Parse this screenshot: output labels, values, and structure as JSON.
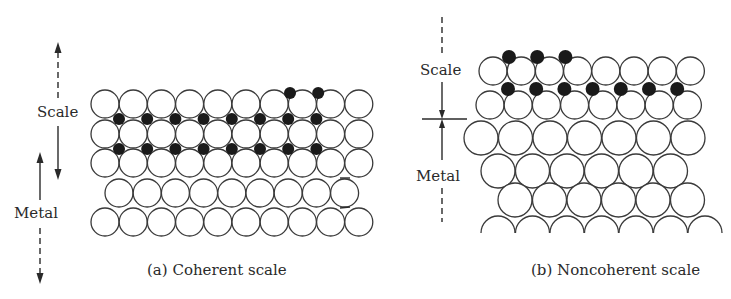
{
  "figure": {
    "panels": [
      {
        "id": "a",
        "caption": "(a)  Coherent scale",
        "labels": {
          "scale": "Scale",
          "metal": "Metal"
        },
        "lattice": {
          "rows": [
            {
              "y": 104,
              "x0": 105,
              "count": 10,
              "r": 14,
              "pitch": 28.2
            },
            {
              "y": 134,
              "x0": 105,
              "count": 10,
              "r": 14,
              "pitch": 28.2
            },
            {
              "y": 163,
              "x0": 105,
              "count": 10,
              "r": 14,
              "pitch": 28.2
            },
            {
              "y": 193,
              "x0": 119,
              "count": 9,
              "r": 14,
              "pitch": 28.2
            },
            {
              "y": 222,
              "x0": 105,
              "count": 10,
              "r": 14,
              "pitch": 28.2
            }
          ],
          "dots": [
            {
              "y": 119,
              "x0": 119,
              "count": 8,
              "pitch": 28.2,
              "r": 6
            },
            {
              "y": 149,
              "x0": 119,
              "count": 8,
              "pitch": 28.2,
              "r": 6
            },
            {
              "y": 93,
              "x0": 290,
              "count": 2,
              "pitch": 28.2,
              "r": 6
            }
          ]
        }
      },
      {
        "id": "b",
        "caption": "(b)  Noncoherent scale",
        "labels": {
          "scale": "Scale",
          "metal": "Metal"
        },
        "lattice": {
          "rows": [
            {
              "y": 71,
              "x0": 493,
              "count": 8,
              "r": 14,
              "pitch": 28.2
            },
            {
              "y": 105,
              "x0": 490,
              "count": 8,
              "r": 14,
              "pitch": 28.2
            },
            {
              "y": 138,
              "x0": 481,
              "count": 7,
              "r": 17,
              "pitch": 34.5
            },
            {
              "y": 171,
              "x0": 498,
              "count": 6,
              "r": 17,
              "pitch": 34.5
            },
            {
              "y": 200,
              "x0": 515,
              "count": 6,
              "r": 17,
              "pitch": 34.5
            }
          ],
          "dots": [
            {
              "y": 57,
              "x0": 509,
              "count": 3,
              "pitch": 28.2,
              "r": 7
            },
            {
              "y": 89,
              "x0": 508,
              "count": 7,
              "pitch": 28.2,
              "r": 7
            }
          ],
          "bottom_arcs": {
            "y": 233,
            "x0": 498,
            "count": 7,
            "r": 17,
            "pitch": 34.5
          }
        }
      }
    ]
  }
}
